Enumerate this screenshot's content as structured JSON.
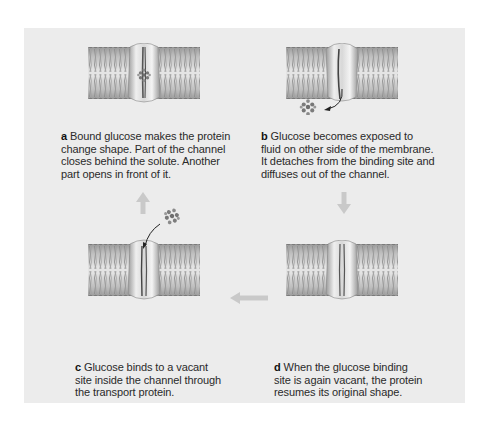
{
  "figure": {
    "background_color": "#ececec",
    "arrow_color": "#c9c9c9",
    "steps": [
      {
        "letter": "a",
        "text": "Bound glucose makes the protein change shape. Part of the channel closes behind the solute. Another part opens in front of it.",
        "lines": [
          "Bound glucose makes the protein",
          "change shape. Part of the channel",
          "closes behind the solute. Another",
          "part opens in front of it."
        ],
        "glucose_position": "inside-channel"
      },
      {
        "letter": "b",
        "text": "Glucose becomes exposed to fluid on other side of the membrane. It detaches from the binding site and diffuses out of the channel.",
        "lines": [
          "Glucose becomes exposed to",
          "fluid on other side of the membrane.",
          "It detaches from the binding site and",
          "diffuses out of the channel."
        ],
        "glucose_position": "below-membrane"
      },
      {
        "letter": "c",
        "text": "Glucose binds to a vacant site inside the channel through the transport protein.",
        "lines": [
          "Glucose binds to a vacant",
          "site inside the channel through",
          "the transport protein."
        ],
        "glucose_position": "above-membrane"
      },
      {
        "letter": "d",
        "text": "When the glucose binding site is again vacant, the protein resumes its original shape.",
        "lines": [
          "When the glucose binding",
          "site is again vacant, the protein",
          "resumes its original shape."
        ],
        "glucose_position": "none"
      }
    ],
    "flow_arrows": [
      {
        "from": "c",
        "to": "a",
        "direction": "up"
      },
      {
        "from": "b",
        "to": "d",
        "direction": "down"
      },
      {
        "from": "d",
        "to": "c",
        "direction": "left"
      }
    ]
  }
}
